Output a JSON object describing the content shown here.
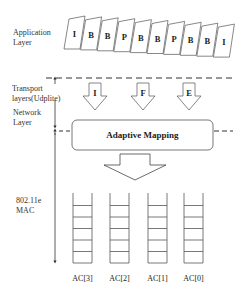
{
  "layers": {
    "application": {
      "line1": "Application",
      "line2": "Layer"
    },
    "transport": {
      "line1": "Transport",
      "line2": "layers(Udplite)"
    },
    "network": {
      "line1": "Network",
      "line2": "Layer"
    },
    "mac": {
      "line1": "802.11e",
      "line2": "MAC"
    }
  },
  "frames": [
    "I",
    "B",
    "B",
    "P",
    "B",
    "B",
    "P",
    "B",
    "B",
    "I"
  ],
  "transport_arrows": [
    "I",
    "F",
    "E"
  ],
  "mapping_box": {
    "label": "Adaptive Mapping"
  },
  "queues": [
    {
      "label": "AC[3]",
      "slots": 5
    },
    {
      "label": "AC[2]",
      "slots": 5
    },
    {
      "label": "AC[1]",
      "slots": 5
    },
    {
      "label": "AC[0]",
      "slots": 5
    }
  ],
  "colors": {
    "line": "#333333",
    "background": "#ffffff"
  }
}
